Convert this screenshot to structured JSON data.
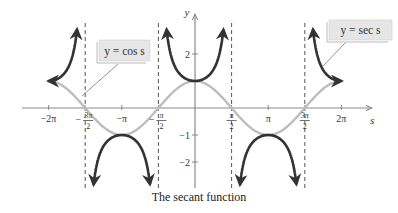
{
  "chart_data": {
    "type": "line",
    "title": "The secant function",
    "xlabel": "s",
    "ylabel": "y",
    "xlim": [
      -7.2,
      7.5
    ],
    "ylim": [
      -3.0,
      3.2
    ],
    "grid": false,
    "x_ticks": [
      {
        "value": -6.2832,
        "label": "−2π"
      },
      {
        "value": -4.7124,
        "label": "−3π/2"
      },
      {
        "value": -3.1416,
        "label": "−π"
      },
      {
        "value": -1.5708,
        "label": "−π/2"
      },
      {
        "value": 1.5708,
        "label": "π/2"
      },
      {
        "value": 3.1416,
        "label": "π"
      },
      {
        "value": 4.7124,
        "label": "3π/2"
      },
      {
        "value": 6.2832,
        "label": "2π"
      }
    ],
    "y_ticks": [
      {
        "value": 2,
        "label": "2"
      },
      {
        "value": -1,
        "label": "−1"
      },
      {
        "value": -2,
        "label": "−2"
      }
    ],
    "asymptotes": [
      -4.7124,
      -1.5708,
      1.5708,
      4.7124
    ],
    "series": [
      {
        "name": "y = cos s",
        "function": "cos",
        "domain": [
          -6.2832,
          6.2832
        ],
        "color": "#bdbdbd"
      },
      {
        "name": "y = sec s",
        "function": "sec",
        "domain": [
          -6.2832,
          6.2832
        ],
        "color": "#333333",
        "clip_y": [
          -3.0,
          3.2
        ]
      }
    ],
    "annotations": [
      {
        "text": "y = cos s",
        "points_to": "cos curve near s = -3π/2"
      },
      {
        "text": "y = sec s",
        "points_to": "sec curve near s = 3π/2"
      }
    ],
    "legend_position": "callout-labels"
  },
  "labels": {
    "cos_label": "y = cos s",
    "sec_label": "y = sec s",
    "caption": "The secant function",
    "x_axis": "s",
    "y_axis": "y"
  },
  "colors": {
    "axis": "#8a8a8a",
    "cos": "#bdbdbd",
    "sec": "#333333",
    "asymptote": "#555555",
    "label_bg": "#e6e6e6"
  }
}
